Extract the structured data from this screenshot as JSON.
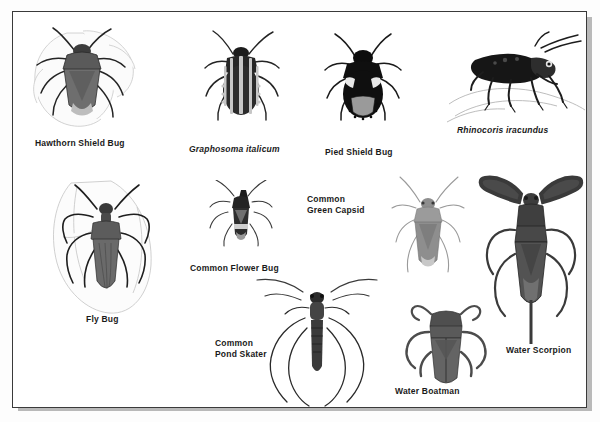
{
  "plate": {
    "title": "Illustrated plate of true bugs (Hemiptera)",
    "background_color": "#ffffff",
    "border_color": "#3a3a3a",
    "shadow_color": "#b9b9b9",
    "text_color": "#1a1a1a"
  },
  "specimens": [
    {
      "id": "hawthorn-shield-bug",
      "label": "Hawthorn Shield Bug",
      "italic": false,
      "art": "shield-bug-on-leaf",
      "body_color": "#6e6e6e",
      "art_box": {
        "x": 22,
        "y": 24,
        "w": 125,
        "h": 105
      },
      "caption_pos": {
        "x": 24,
        "y": 138
      }
    },
    {
      "id": "graphosoma-italicum",
      "label": "Graphosoma italicum",
      "italic": true,
      "art": "striped-shield-bug",
      "body_color": "#2e2e2e",
      "art_box": {
        "x": 203,
        "y": 30,
        "w": 66,
        "h": 88
      },
      "caption_pos": {
        "x": 188,
        "y": 143
      }
    },
    {
      "id": "pied-shield-bug",
      "label": "Pied Shield Bug",
      "italic": false,
      "art": "black-white-shield-bug",
      "body_color": "#141414",
      "art_box": {
        "x": 324,
        "y": 34,
        "w": 62,
        "h": 80
      },
      "caption_pos": {
        "x": 324,
        "y": 146
      }
    },
    {
      "id": "rhinocoris-iracundus",
      "label": "Rhinocoris iracundus",
      "italic": true,
      "art": "assassin-bug-side-view",
      "body_color": "#1b1b1b",
      "art_box": {
        "x": 451,
        "y": 32,
        "w": 118,
        "h": 86
      },
      "caption_pos": {
        "x": 456,
        "y": 124
      }
    },
    {
      "id": "fly-bug",
      "label": "Fly Bug",
      "italic": false,
      "art": "fly-bug-on-leaf",
      "body_color": "#555555",
      "art_box": {
        "x": 41,
        "y": 176,
        "w": 112,
        "h": 135
      },
      "caption_pos": {
        "x": 85,
        "y": 313
      }
    },
    {
      "id": "common-flower-bug",
      "label": "Common Flower Bug",
      "italic": false,
      "art": "small-flower-bug",
      "body_color": "#303030",
      "art_box": {
        "x": 212,
        "y": 180,
        "w": 52,
        "h": 62
      },
      "caption_pos": {
        "x": 189,
        "y": 259
      }
    },
    {
      "id": "common-green-capsid",
      "label": "Common\nGreen Capsid",
      "italic": false,
      "art": "capsid-bug",
      "body_color": "#8d8d8d",
      "art_box": {
        "x": 383,
        "y": 176,
        "w": 66,
        "h": 98
      },
      "caption_pos": {
        "x": 306,
        "y": 193
      }
    },
    {
      "id": "common-pond-skater",
      "label": "Common\nPond Skater",
      "italic": false,
      "art": "pond-skater",
      "body_color": "#3a3a3a",
      "art_box": {
        "x": 256,
        "y": 268,
        "w": 112,
        "h": 122
      },
      "caption_pos": {
        "x": 214,
        "y": 337
      }
    },
    {
      "id": "water-boatman",
      "label": "Water Boatman",
      "italic": false,
      "art": "water-boatman",
      "body_color": "#5a5a5a",
      "art_box": {
        "x": 400,
        "y": 298,
        "w": 64,
        "h": 80
      },
      "caption_pos": {
        "x": 394,
        "y": 386
      }
    },
    {
      "id": "water-scorpion",
      "label": "Water Scorpion",
      "italic": false,
      "art": "water-scorpion",
      "body_color": "#4a4a4a",
      "art_box": {
        "x": 476,
        "y": 170,
        "w": 98,
        "h": 170
      },
      "caption_pos": {
        "x": 493,
        "y": 343
      }
    }
  ]
}
